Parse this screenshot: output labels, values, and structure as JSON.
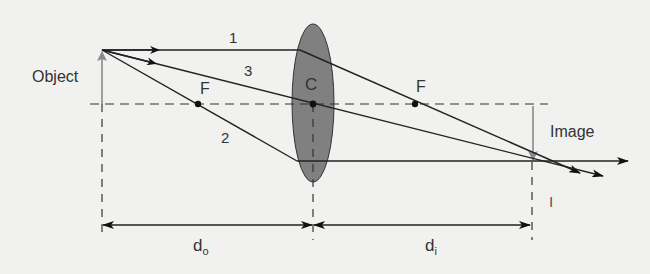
{
  "diagram": {
    "labels": {
      "object": "Object",
      "image": "Image",
      "lens_center": "C",
      "focal_left": "F",
      "focal_right": "F",
      "ray1": "1",
      "ray2": "2",
      "ray3": "3",
      "image_inverted_marker": "I",
      "d_object": "d",
      "d_object_sub": "o",
      "d_image": "d",
      "d_image_sub": "i"
    },
    "colors": {
      "background": "#f1f1ef",
      "lens_fill": "#808080",
      "ray": "#222222",
      "object_arrow": "#8a8a8a",
      "axis_dash": "#333333",
      "text": "#333333"
    },
    "geometry": {
      "optical_axis_y": 104,
      "object_x": 102,
      "object_tip_y": 50,
      "lens_center_x": 313,
      "focal_left_x": 198,
      "focal_right_x": 415,
      "image_x": 530,
      "image_tip_y": 161
    }
  }
}
